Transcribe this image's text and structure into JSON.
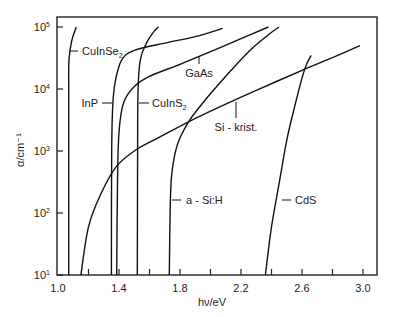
{
  "chart_data": {
    "type": "line",
    "title": "",
    "xlabel": "hν/eV",
    "ylabel": "α/cm⁻¹",
    "xlim": [
      1.0,
      3.1
    ],
    "ylim": [
      10,
      100000
    ],
    "yscale": "log",
    "grid": false,
    "legend": "inline labels",
    "x_ticks": [
      "1.0",
      "1.4",
      "1.8",
      "2.2",
      "2.6",
      "3.0"
    ],
    "x_minor_ticks": [
      1.2,
      1.6,
      2.0,
      2.4,
      2.8
    ],
    "y_ticks": [
      {
        "value": 10,
        "label": "10",
        "exp": "1"
      },
      {
        "value": 100,
        "label": "10",
        "exp": "2"
      },
      {
        "value": 1000,
        "label": "10",
        "exp": "3"
      },
      {
        "value": 10000,
        "label": "10",
        "exp": "4"
      },
      {
        "value": 100000,
        "label": "10",
        "exp": "5"
      }
    ],
    "series": [
      {
        "name": "CuInSe2",
        "label": "CuInSe",
        "sub": "2",
        "points": [
          [
            1.07,
            10
          ],
          [
            1.07,
            1000
          ],
          [
            1.07,
            10000
          ],
          [
            1.072,
            30000
          ],
          [
            1.09,
            60000
          ],
          [
            1.12,
            100000
          ]
        ]
      },
      {
        "name": "InP",
        "label": "InP",
        "points": [
          [
            1.35,
            10
          ],
          [
            1.352,
            1000
          ],
          [
            1.36,
            6000
          ],
          [
            1.38,
            15000
          ],
          [
            1.42,
            30000
          ],
          [
            1.5,
            42000
          ],
          [
            1.7,
            55000
          ],
          [
            1.9,
            70000
          ],
          [
            2.08,
            95000
          ]
        ]
      },
      {
        "name": "GaAs",
        "label": "GaAs",
        "points": [
          [
            1.385,
            10
          ],
          [
            1.39,
            300
          ],
          [
            1.4,
            2000
          ],
          [
            1.43,
            6000
          ],
          [
            1.5,
            11000
          ],
          [
            1.6,
            16000
          ],
          [
            1.8,
            25000
          ],
          [
            2.0,
            40000
          ],
          [
            2.2,
            65000
          ],
          [
            2.38,
            100000
          ]
        ]
      },
      {
        "name": "CuInS2",
        "label": "CuInS",
        "sub": "2",
        "points": [
          [
            1.52,
            10
          ],
          [
            1.522,
            1000
          ],
          [
            1.525,
            10000
          ],
          [
            1.54,
            30000
          ],
          [
            1.58,
            55000
          ],
          [
            1.63,
            85000
          ],
          [
            1.66,
            100000
          ]
        ]
      },
      {
        "name": "a-Si:H",
        "label": "a - Si:H",
        "points": [
          [
            1.73,
            10
          ],
          [
            1.735,
            100
          ],
          [
            1.745,
            400
          ],
          [
            1.78,
            1200
          ],
          [
            1.85,
            2800
          ],
          [
            1.95,
            6000
          ],
          [
            2.1,
            16000
          ],
          [
            2.25,
            40000
          ],
          [
            2.38,
            75000
          ],
          [
            2.45,
            100000
          ]
        ]
      },
      {
        "name": "Si kristallin",
        "label": "Si - krist.",
        "points": [
          [
            1.15,
            10
          ],
          [
            1.2,
            60
          ],
          [
            1.28,
            200
          ],
          [
            1.38,
            550
          ],
          [
            1.5,
            1000
          ],
          [
            1.65,
            1600
          ],
          [
            1.85,
            2900
          ],
          [
            2.05,
            5000
          ],
          [
            2.3,
            9500
          ],
          [
            2.6,
            20000
          ],
          [
            2.8,
            32000
          ],
          [
            2.98,
            50000
          ]
        ]
      },
      {
        "name": "CdS",
        "label": "CdS",
        "points": [
          [
            2.36,
            10
          ],
          [
            2.4,
            60
          ],
          [
            2.45,
            300
          ],
          [
            2.5,
            1500
          ],
          [
            2.55,
            5000
          ],
          [
            2.6,
            15000
          ],
          [
            2.63,
            25000
          ],
          [
            2.66,
            35000
          ]
        ]
      }
    ],
    "annotations": [
      {
        "text": "CuInSe2",
        "series": "CuInSe2"
      },
      {
        "text": "InP",
        "series": "InP"
      },
      {
        "text": "GaAs",
        "series": "GaAs"
      },
      {
        "text": "CuInS2",
        "series": "CuInS2"
      },
      {
        "text": "a - Si:H",
        "series": "a-Si:H"
      },
      {
        "text": "Si - krist.",
        "series": "Si kristallin"
      },
      {
        "text": "CdS",
        "series": "CdS"
      }
    ]
  },
  "axes": {
    "xlabel": "hν/eV",
    "ylabel": "α/cm⁻¹"
  }
}
